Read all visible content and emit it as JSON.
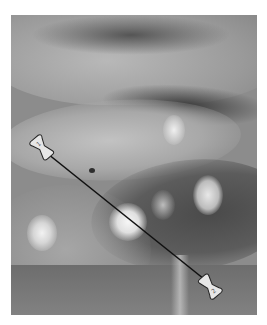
{
  "caption": {
    "text": "",
    "note": "cut-off, illegible"
  },
  "photo": {
    "description": "grayscale clinical photograph of tissue with several pale nodular lesions",
    "palette": {
      "background": "#8c8c8c",
      "dark_fold": "#3f3f3f",
      "light_tissue": "#c8c8c8",
      "lesion": "#f2f2f2"
    }
  },
  "annotation": {
    "line_color": "#111111",
    "pin_fill": "#e6e6e6",
    "pin_stroke": "#222222",
    "markers": [
      {
        "label": "1",
        "x": 45,
        "y": 150
      },
      {
        "label": "2",
        "x": 207,
        "y": 283
      }
    ]
  }
}
